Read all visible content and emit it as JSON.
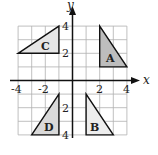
{
  "diagram": {
    "type": "coordinate-grid",
    "axes": {
      "x_label": "x",
      "y_label": "y",
      "x_range": [
        -4,
        4
      ],
      "y_range": [
        -4,
        4
      ],
      "x_ticks": [
        {
          "value": -4,
          "label": "-4"
        },
        {
          "value": -2,
          "label": "-2"
        },
        {
          "value": 2,
          "label": "2"
        },
        {
          "value": 4,
          "label": "4"
        }
      ],
      "y_ticks": [
        {
          "value": 4,
          "label": "4"
        },
        {
          "value": 2,
          "label": "2"
        },
        {
          "value": -2,
          "label": "2"
        },
        {
          "value": -4,
          "label": "4"
        }
      ]
    },
    "shapes": [
      {
        "name": "C",
        "label": "C",
        "vertices": [
          [
            -4,
            2
          ],
          [
            -1,
            4
          ],
          [
            -1,
            2
          ]
        ],
        "fill": "#e6e6e6"
      },
      {
        "name": "A",
        "label": "A",
        "vertices": [
          [
            2,
            4
          ],
          [
            2,
            1
          ],
          [
            4,
            1
          ]
        ],
        "fill": "#bdbdbd"
      },
      {
        "name": "D",
        "label": "D",
        "vertices": [
          [
            -1,
            -1
          ],
          [
            -3,
            -4
          ],
          [
            -1,
            -4
          ]
        ],
        "fill": "#d9d9d9"
      },
      {
        "name": "B",
        "label": "B",
        "vertices": [
          [
            1,
            -1
          ],
          [
            1,
            -4
          ],
          [
            3,
            -4
          ]
        ],
        "fill": "#ededed"
      }
    ],
    "colors": {
      "grid": "#b0b0b0",
      "axis": "#111111",
      "outline": "#111111"
    }
  }
}
